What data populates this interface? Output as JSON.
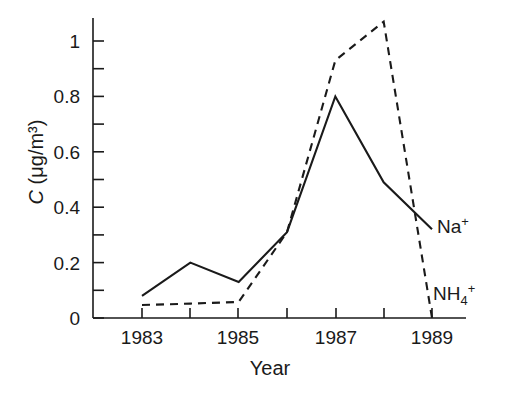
{
  "chart_data": {
    "type": "line",
    "title": "",
    "xlabel": "Year",
    "ylabel": "C (μg/m³)",
    "ylabel_symbol": "C",
    "ylabel_units": "(μg/m³)",
    "xlim": [
      1983,
      1989.4
    ],
    "ylim": [
      0,
      1.12
    ],
    "grid": false,
    "legend_position": "inline-right",
    "x": [
      1983,
      1984,
      1985,
      1986,
      1987,
      1988,
      1989
    ],
    "xticks": [
      1983,
      1984,
      1985,
      1986,
      1987,
      1988,
      1989
    ],
    "xtick_labels": [
      "1983",
      "",
      "1985",
      "",
      "1987",
      "",
      "1989"
    ],
    "yticks": [
      0,
      0.1,
      0.2,
      0.3,
      0.4,
      0.5,
      0.6,
      0.7,
      0.8,
      0.9,
      1.0
    ],
    "ytick_labels": [
      "0",
      "",
      "0.2",
      "",
      "0.4",
      "",
      "0.6",
      "",
      "0.8",
      "",
      "1"
    ],
    "series": [
      {
        "name": "Na⁺",
        "label_text": "Na",
        "label_sup": "+",
        "label_sub": "",
        "style": "solid",
        "color": "#1a1a1a",
        "values": [
          0.08,
          0.2,
          0.13,
          0.31,
          0.8,
          0.49,
          0.32
        ]
      },
      {
        "name": "NH₄⁺",
        "label_text": "NH",
        "label_sub": "4",
        "label_sup": "+",
        "style": "dashed",
        "color": "#1a1a1a",
        "values": [
          0.047,
          0.052,
          0.058,
          0.31,
          0.93,
          1.07,
          0.0
        ]
      }
    ]
  },
  "axes": {
    "y_label_symbol": "C",
    "y_label_units": "(μg/m³)",
    "x_label": "Year"
  }
}
